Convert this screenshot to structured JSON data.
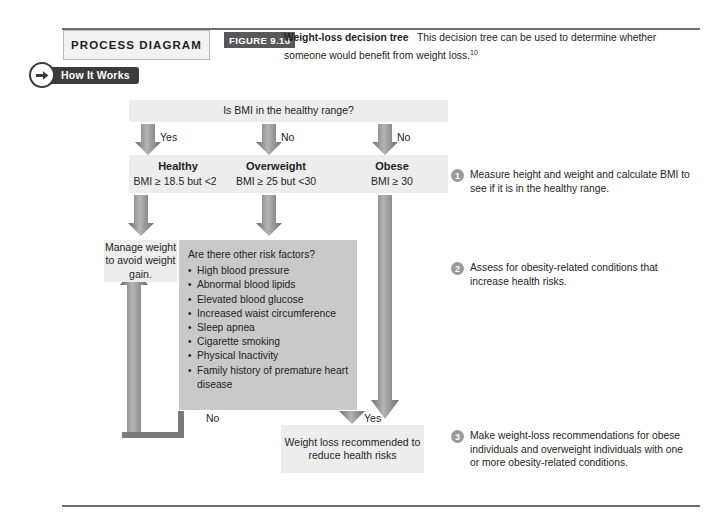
{
  "header": {
    "process_diagram_label": "PROCESS DIAGRAM",
    "how_it_works_label": "How It Works",
    "figure_tag": "FIGURE 9.16",
    "figure_title": "Weight-loss decision tree",
    "figure_caption": "This decision tree can be used to determine whether someone would benefit from weight loss.",
    "figure_superscript": "10"
  },
  "flow": {
    "question": "Is BMI in the healthy range?",
    "branch_labels": {
      "healthy": "Yes",
      "overweight": "No",
      "obese": "No",
      "risk_yes": "Yes",
      "risk_no": "No"
    },
    "categories": [
      {
        "title": "Healthy",
        "criteria": "BMI ≥ 18.5 but <25"
      },
      {
        "title": "Overweight",
        "criteria": "BMI ≥ 25 but <30"
      },
      {
        "title": "Obese",
        "criteria": "BMI ≥ 30"
      }
    ],
    "manage_box": "Manage weight to avoid weight gain.",
    "risk_box": {
      "heading": "Are there other risk factors?",
      "items": [
        "High blood pressure",
        "Abnormal blood lipids",
        "Elevated blood glucose",
        "Increased waist circumference",
        "Sleep apnea",
        "Cigarette smoking",
        "Physical Inactivity",
        "Family history of premature heart disease"
      ]
    },
    "outcome_box": "Weight loss recommended to reduce health risks"
  },
  "steps": [
    {
      "number": "1",
      "text": "Measure height and weight and calculate BMI to see if it is in the healthy range."
    },
    {
      "number": "2",
      "text": "Assess for obesity-related conditions that increase health risks."
    },
    {
      "number": "3",
      "text": "Make weight-loss recommendations for obese individuals and overweight individuals with one or more obesity-related conditions."
    }
  ],
  "colors": {
    "box_light": "#ededed",
    "box_mid": "#c9c9c9",
    "badge_dark": "#3b3b3b",
    "tag_gray": "#58585a",
    "arrow_gray": "#8c8c8c"
  }
}
